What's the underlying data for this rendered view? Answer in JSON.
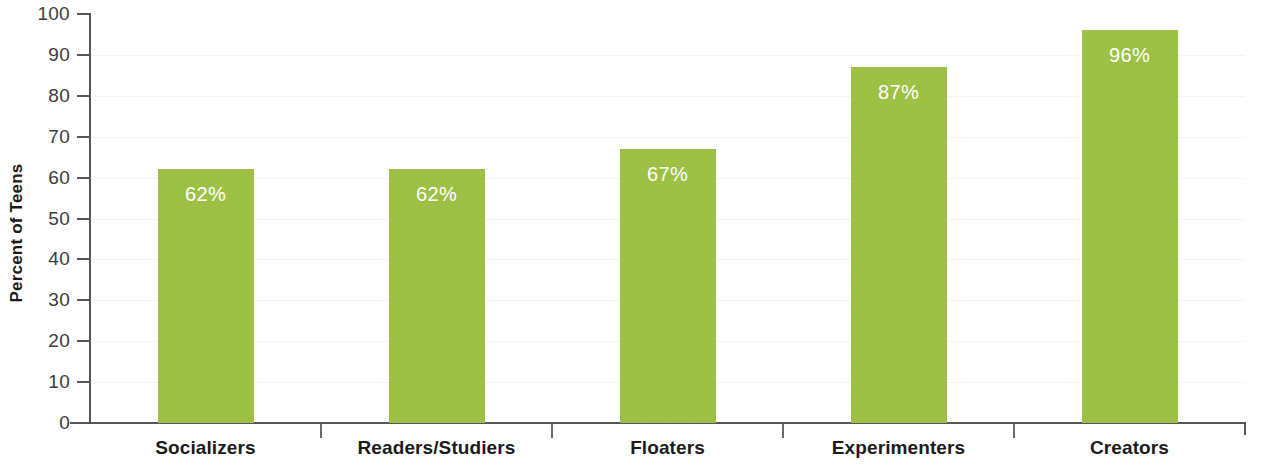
{
  "chart_data": {
    "type": "bar",
    "title": "",
    "subtitle": "",
    "xlabel": "",
    "ylabel": "Percent of Teens",
    "ylim": [
      0,
      100
    ],
    "ytick_step": 10,
    "grid": false,
    "legend": null,
    "value_label_suffix": "%",
    "categories": [
      "Socializers",
      "Readers/Studiers",
      "Floaters",
      "Experimenters",
      "Creators"
    ],
    "values": [
      62,
      62,
      67,
      87,
      96
    ],
    "value_labels": [
      "62%",
      "62%",
      "67%",
      "87%",
      "96%"
    ],
    "ytick_labels": [
      "100",
      "90",
      "80",
      "70",
      "60",
      "50",
      "40",
      "30",
      "20",
      "10",
      "0"
    ],
    "ytick_values": [
      100,
      90,
      80,
      70,
      60,
      50,
      40,
      30,
      20,
      10,
      0
    ],
    "colors": {
      "bar": "#9dbf43",
      "value_label": "#ffffff",
      "axis": "#55565a",
      "tick_label": "#3c3c3c",
      "category_label": "#1b1b1b",
      "background": "#ffffff"
    }
  }
}
